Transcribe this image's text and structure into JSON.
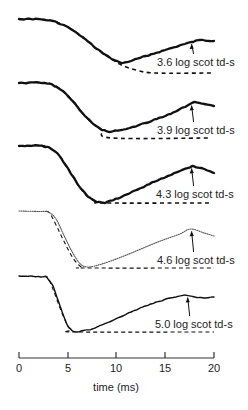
{
  "chart_data": {
    "type": "line",
    "title": "",
    "xlabel": "time (ms)",
    "ylabel": "",
    "xlim": [
      0,
      20
    ],
    "x_ticks": [
      0,
      5,
      10,
      15,
      20
    ],
    "x_tick_labels": [
      "0",
      "5",
      "10",
      "15",
      "20"
    ],
    "grid": false,
    "legend": "none (per-trace annotations)",
    "series": [
      {
        "name": "3.6 log scot td-s",
        "label": "3.6 log scot td-s",
        "style": "solid-bold",
        "offset_y": 19,
        "points_ms_px": [
          [
            0,
            0
          ],
          [
            2,
            0
          ],
          [
            3.5,
            2
          ],
          [
            5,
            8
          ],
          [
            6.5,
            18
          ],
          [
            8,
            30
          ],
          [
            9.5,
            40
          ],
          [
            10.5,
            44
          ],
          [
            11.5,
            42
          ],
          [
            13,
            37
          ],
          [
            15,
            31
          ],
          [
            17,
            25
          ],
          [
            18.5,
            21
          ],
          [
            20,
            22
          ]
        ],
        "model_points_ms_px": [
          [
            0,
            0
          ],
          [
            2,
            0
          ],
          [
            3.5,
            2
          ],
          [
            5,
            8
          ],
          [
            6.5,
            18
          ],
          [
            8,
            30
          ],
          [
            9.5,
            40
          ],
          [
            10.5,
            46
          ],
          [
            12,
            51
          ],
          [
            14,
            54
          ],
          [
            20,
            54
          ]
        ],
        "annotation_arrow_ms": 17.7
      },
      {
        "name": "3.9 log scot td-s",
        "label": "3.9 log scot td-s",
        "style": "solid-bold",
        "offset_y": 83,
        "points_ms_px": [
          [
            0,
            0
          ],
          [
            2,
            -0.5
          ],
          [
            3.3,
            1
          ],
          [
            4.5,
            8
          ],
          [
            5.5,
            18
          ],
          [
            6.5,
            30
          ],
          [
            7.5,
            40
          ],
          [
            8.5,
            47
          ],
          [
            9.3,
            49
          ],
          [
            11,
            46
          ],
          [
            13,
            40
          ],
          [
            15,
            33
          ],
          [
            17,
            24
          ],
          [
            18,
            19
          ],
          [
            19,
            21
          ],
          [
            20,
            23
          ]
        ],
        "model_points_ms_px": [
          [
            0,
            0
          ],
          [
            2,
            -0.5
          ],
          [
            3.3,
            1
          ],
          [
            4.5,
            8
          ],
          [
            5.5,
            18
          ],
          [
            6.5,
            30
          ],
          [
            7.5,
            40
          ],
          [
            8.5,
            47
          ],
          [
            9.5,
            55
          ],
          [
            19.5,
            55
          ]
        ],
        "annotation_arrow_ms": 17.7
      },
      {
        "name": "4.3 log scot td-s",
        "label": "4.3 log scot td-s",
        "style": "solid-bold",
        "offset_y": 146,
        "points_ms_px": [
          [
            0,
            0
          ],
          [
            2,
            -0.5
          ],
          [
            3,
            1
          ],
          [
            4,
            8
          ],
          [
            5,
            22
          ],
          [
            6,
            38
          ],
          [
            7,
            50
          ],
          [
            8,
            56
          ],
          [
            8.8,
            57
          ],
          [
            10.5,
            51
          ],
          [
            12.5,
            42
          ],
          [
            14.5,
            33
          ],
          [
            16.5,
            25
          ],
          [
            17.8,
            20
          ],
          [
            19,
            23
          ],
          [
            20,
            27
          ]
        ],
        "model_points_ms_px": [
          [
            0,
            0
          ],
          [
            2,
            -0.5
          ],
          [
            3,
            1
          ],
          [
            4,
            8
          ],
          [
            5,
            22
          ],
          [
            6,
            38
          ],
          [
            7,
            50
          ],
          [
            8,
            56
          ],
          [
            8.8,
            57
          ],
          [
            19.5,
            57
          ]
        ],
        "annotation_arrow_ms": 17.7
      },
      {
        "name": "4.6 log scot td-s",
        "label": "4.6 log scot td-s",
        "style": "dotted",
        "offset_y": 211,
        "points_ms_px": [
          [
            0,
            0
          ],
          [
            2,
            0.5
          ],
          [
            3,
            1
          ],
          [
            3.8,
            8
          ],
          [
            4.6,
            24
          ],
          [
            5.4,
            40
          ],
          [
            6.2,
            52
          ],
          [
            7,
            56
          ],
          [
            8.5,
            53
          ],
          [
            10.5,
            46
          ],
          [
            12.5,
            38
          ],
          [
            14.5,
            30
          ],
          [
            16.5,
            23
          ],
          [
            17.6,
            18
          ],
          [
            19,
            22
          ],
          [
            20,
            25
          ]
        ],
        "model_points_ms_px": [
          [
            2.8,
            0
          ],
          [
            3.2,
            3
          ],
          [
            4,
            18
          ],
          [
            4.8,
            34
          ],
          [
            5.6,
            48
          ],
          [
            6.4,
            56
          ],
          [
            7,
            57
          ],
          [
            20,
            57
          ]
        ],
        "annotation_arrow_ms": 17.7
      },
      {
        "name": "5.0 log scot td-s",
        "label": "5.0 log scot td-s",
        "style": "solid-thin",
        "offset_y": 276,
        "points_ms_px": [
          [
            0,
            0
          ],
          [
            2,
            0.5
          ],
          [
            2.8,
            1
          ],
          [
            3.5,
            10
          ],
          [
            4,
            24
          ],
          [
            4.5,
            38
          ],
          [
            5,
            50
          ],
          [
            5.5,
            55
          ],
          [
            6,
            56
          ],
          [
            7.5,
            53
          ],
          [
            9.5,
            45
          ],
          [
            11.5,
            36
          ],
          [
            13.5,
            28
          ],
          [
            15.5,
            22
          ],
          [
            17,
            19
          ],
          [
            18,
            21
          ],
          [
            19,
            22
          ],
          [
            20,
            21
          ]
        ],
        "model_points_ms_px": [
          [
            2.6,
            0
          ],
          [
            3,
            2
          ],
          [
            3.6,
            16
          ],
          [
            4.2,
            32
          ],
          [
            4.8,
            46
          ],
          [
            5.3,
            54
          ],
          [
            5.8,
            56
          ],
          [
            20,
            56
          ]
        ],
        "annotation_arrow_ms": 17.3
      }
    ]
  },
  "axis": {
    "title": "time (ms)",
    "ticks": [
      "0",
      "5",
      "10",
      "15",
      "20"
    ]
  },
  "annotations": [
    "3.6 log scot td-s",
    "3.9 log scot td-s",
    "4.3 log scot td-s",
    "4.6 log scot td-s",
    "5.0 log scot td-s"
  ]
}
